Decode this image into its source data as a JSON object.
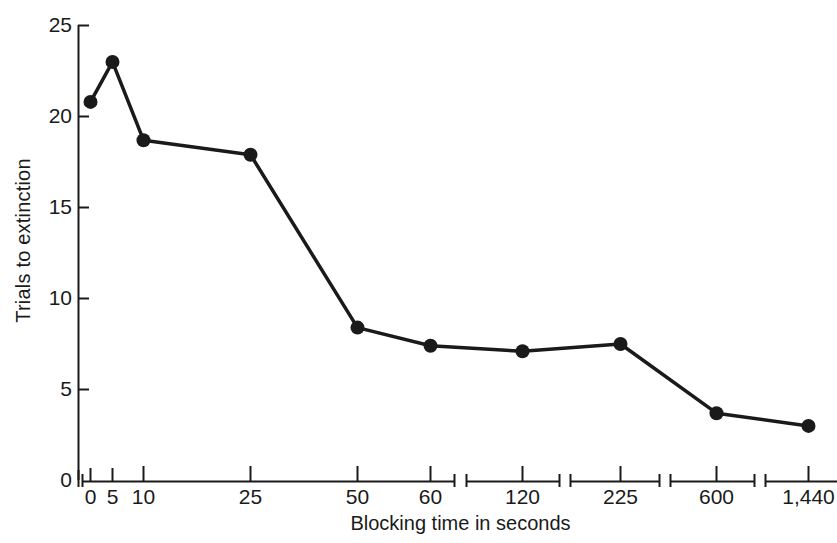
{
  "chart_data": {
    "type": "line",
    "title": "",
    "xlabel": "Blocking time in seconds",
    "ylabel": "Trials to extinction",
    "categories": [
      "0",
      "5",
      "10",
      "25",
      "50",
      "60",
      "120",
      "225",
      "600",
      "1,440"
    ],
    "x": [
      0,
      5,
      10,
      25,
      50,
      60,
      120,
      225,
      600,
      1440
    ],
    "values": [
      20.8,
      23.0,
      18.7,
      17.9,
      8.4,
      7.4,
      7.1,
      7.5,
      3.7,
      3.0
    ],
    "series": [
      {
        "name": "Trials to extinction",
        "values": [
          20.8,
          23.0,
          18.7,
          17.9,
          8.4,
          7.4,
          7.1,
          7.5,
          3.7,
          3.0
        ]
      }
    ],
    "ylim": [
      0,
      25
    ],
    "yticks": [
      0,
      5,
      10,
      15,
      20,
      25
    ],
    "ytick_labels": [
      "0",
      "5",
      "10",
      "15",
      "20",
      "25"
    ],
    "xtick_labels": [
      "0",
      "5",
      "10",
      "25",
      "50",
      "60",
      "120",
      "225",
      "600",
      "1,440"
    ],
    "grid": false,
    "legend": "none",
    "axis_breaks": true,
    "marker": "filled-circle",
    "line_color": "#1a1a1a",
    "marker_color": "#1a1a1a",
    "background_color": "#ffffff"
  },
  "axis": {
    "y_label": "Trials to extinction",
    "x_label": "Blocking time in seconds"
  }
}
